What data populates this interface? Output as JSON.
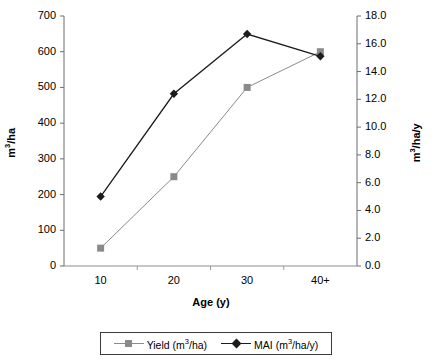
{
  "chart_data": {
    "type": "line",
    "title": "",
    "xlabel": "Age (y)",
    "categories": [
      "10",
      "20",
      "30",
      "40+"
    ],
    "grid": false,
    "legend_position": "bottom",
    "axes": {
      "left": {
        "label": "m3/ha",
        "label_prefix": "m",
        "label_sup": "3",
        "label_suffix": "/ha",
        "min": 0,
        "max": 700,
        "step": 100,
        "ticks": [
          "0",
          "100",
          "200",
          "300",
          "400",
          "500",
          "600",
          "700"
        ]
      },
      "right": {
        "label": "m3/ha/y",
        "label_prefix": "m",
        "label_sup": "3",
        "label_suffix": "/ha/y",
        "min": 0.0,
        "max": 18.0,
        "step": 2.0,
        "ticks": [
          "0.0",
          "2.0",
          "4.0",
          "6.0",
          "8.0",
          "10.0",
          "12.0",
          "14.0",
          "16.0",
          "18.0"
        ]
      }
    },
    "series": [
      {
        "name": "Yield (m3/ha)",
        "label_prefix": "Yield (m",
        "label_sup": "3",
        "label_suffix": "/ha)",
        "axis": "left",
        "marker": "square",
        "color": "#8a8a8a",
        "values": [
          50,
          250,
          500,
          600
        ]
      },
      {
        "name": "MAI (m3/ha/y)",
        "label_prefix": "MAI (m",
        "label_sup": "3",
        "label_suffix": "/ha/y)",
        "axis": "right",
        "marker": "diamond",
        "color": "#1c1c1c",
        "values": [
          5.0,
          12.4,
          16.7,
          15.1
        ]
      }
    ]
  }
}
